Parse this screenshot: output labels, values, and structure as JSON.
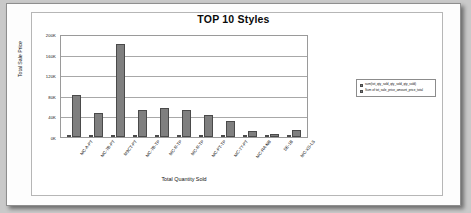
{
  "chart_data": {
    "type": "bar",
    "title": "TOP 10 Styles",
    "xlabel": "Total Quantity Sold",
    "ylabel": "Total Sale Price",
    "ylim": [
      0,
      200000
    ],
    "yticks": [
      "200K",
      "160K",
      "120K",
      "80K",
      "40K",
      "0K"
    ],
    "grid": true,
    "legend_position": "right",
    "categories": [
      "MC-A-PT",
      "MC-7B-PT",
      "M9CT-PT",
      "MC-7B-TP",
      "MC-R-TP",
      "MC-R-TP",
      "MC-PT-TP",
      "MC-7Y-PT",
      "MC-RA-NB",
      "SE-1B",
      "MC-XS-LS"
    ],
    "series": [
      {
        "name": "Total Quantity Sold",
        "values": [
          1200,
          900,
          1100,
          800,
          900,
          700,
          800,
          600,
          300,
          200,
          300
        ]
      },
      {
        "name": "Total Sale Price",
        "values": [
          84000,
          48000,
          185000,
          54000,
          57000,
          54000,
          43000,
          31000,
          12000,
          5000,
          13000
        ]
      }
    ]
  },
  "legend": {
    "entries": [
      {
        "label": "sum(tot_qty_sold_qty_sold_qty_sold)"
      },
      {
        "label": "Sum of tot_sale_price_amount_price_total"
      }
    ]
  }
}
